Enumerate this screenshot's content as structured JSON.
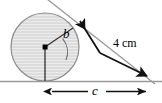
{
  "figure": {
    "type": "geometry-diagram",
    "labels": {
      "angle": "b",
      "hypotenuse": "4 cm",
      "base": "c"
    },
    "colors": {
      "circle_fill": "#d9d9d9",
      "circle_stroke": "#8c8c8c",
      "hatch_line": "#eaeaea",
      "baseline": "#9a9a9a",
      "tangent_line": "#9a9a9a",
      "radius_line": "#3a3a3a",
      "arrow": "#111111",
      "text": "#000000"
    },
    "geometry": {
      "circle_center_x": 45,
      "circle_center_y": 47,
      "circle_radius": 34,
      "baseline_y": 81,
      "tangent_point_x": 74,
      "tangent_point_y": 29,
      "apex_x": 152,
      "apex_y": 81,
      "dimension_left_x": 45,
      "dimension_right_x": 152,
      "dimension_y": 91
    }
  }
}
